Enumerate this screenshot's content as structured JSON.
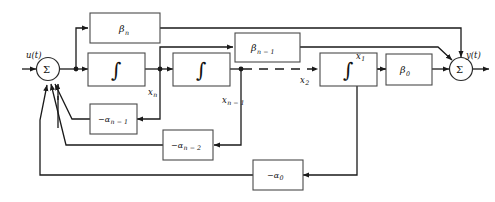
{
  "diagram": {
    "input_signal": "u(t)",
    "output_signal": "y(t)",
    "summers": [
      {
        "name": "input-summer",
        "symbol": "Σ"
      },
      {
        "name": "output-summer",
        "symbol": "Σ"
      }
    ],
    "integrators": [
      {
        "name": "integrator-1",
        "symbol": "∫"
      },
      {
        "name": "integrator-2",
        "symbol": "∫"
      },
      {
        "name": "integrator-3",
        "symbol": "∫"
      }
    ],
    "feedforward_blocks": [
      {
        "name": "beta-n-block",
        "base": "β",
        "sub": "n"
      },
      {
        "name": "beta-n-minus-1-block",
        "base": "β",
        "sub": "n − 1"
      },
      {
        "name": "beta-0-block",
        "base": "β",
        "sub": "0"
      }
    ],
    "feedback_blocks": [
      {
        "name": "alpha-n-minus-1-block",
        "base": "−α",
        "sub": "n − 1"
      },
      {
        "name": "alpha-n-minus-2-block",
        "base": "−α",
        "sub": "n − 2"
      },
      {
        "name": "alpha-0-block",
        "base": "−α",
        "sub": "0"
      }
    ],
    "state_labels": [
      {
        "name": "state-xn",
        "base": "x",
        "sub": "n"
      },
      {
        "name": "state-xn-minus-1",
        "base": "x",
        "sub": "n − 1"
      },
      {
        "name": "state-x2",
        "base": "x",
        "sub": "2"
      },
      {
        "name": "state-x1",
        "base": "x",
        "sub": "1"
      }
    ],
    "ellipsis": "dashed-continuation",
    "colors": {
      "wire": "#1a1a1a",
      "block_stroke": "#4a4a4a",
      "background": "#ffffff"
    }
  }
}
